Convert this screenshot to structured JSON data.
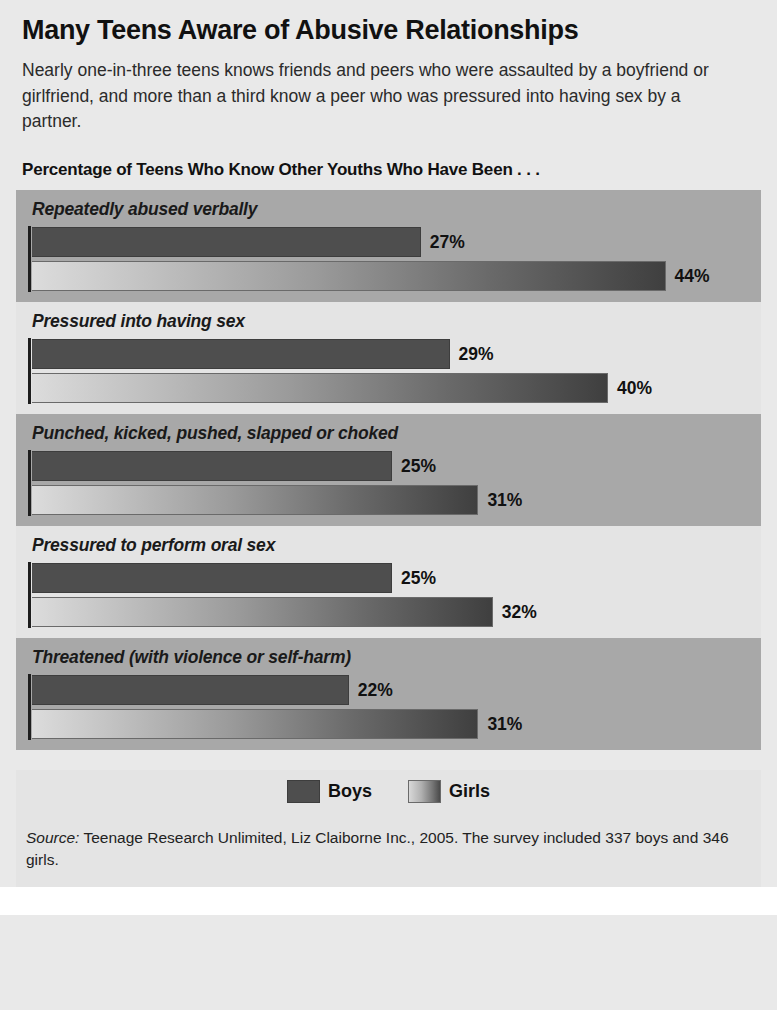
{
  "header": {
    "title": "Many Teens Aware of Abusive Relationships",
    "subtitle": "Nearly one-in-three teens knows friends and peers who were assaulted by a boyfriend or girlfriend, and more than a third know a peer who was pressured into having sex by a partner.",
    "section_label": "Percentage of Teens Who Know Other Youths Who Have Been . . ."
  },
  "legend": {
    "boys_label": "Boys",
    "girls_label": "Girls"
  },
  "source": {
    "prefix": "Source:",
    "text": " Teenage Research Unlimited, Liz Claiborne Inc., 2005. The survey included 337 boys and 346 girls."
  },
  "colors": {
    "band_dark": "#a8a8a8",
    "band_light": "#e4e4e4",
    "page_background": "#e9e9e9",
    "boys_bar": "#4e4e4e",
    "girls_bar_start": "#dcdcdc",
    "girls_bar_end": "#3f3f3f",
    "axis": "#1d1d1d",
    "text": "#111111"
  },
  "chart_data": {
    "type": "bar",
    "orientation": "horizontal",
    "title": "Many Teens Aware of Abusive Relationships",
    "subtitle": "Nearly one-in-three teens knows friends and peers who were assaulted by a boyfriend or girlfriend, and more than a third know a peer who was pressured into having sex by a partner.",
    "axis_label": "Percentage of Teens Who Know Other Youths Who Have Been . . .",
    "xlabel": "",
    "ylabel": "",
    "xlim": [
      0,
      50
    ],
    "grid": false,
    "legend_position": "bottom-center",
    "units": "%",
    "categories": [
      "Repeatedly abused verbally",
      "Pressured into having sex",
      "Punched, kicked, pushed, slapped or choked",
      "Pressured to perform oral sex",
      "Threatened (with violence or self-harm)"
    ],
    "series": [
      {
        "name": "Boys",
        "values": [
          27,
          29,
          25,
          25,
          22
        ],
        "labels": [
          "27%",
          "29%",
          "25%",
          "25%",
          "22%"
        ]
      },
      {
        "name": "Girls",
        "values": [
          44,
          40,
          31,
          32,
          31
        ],
        "labels": [
          "44%",
          "40%",
          "31%",
          "32%",
          "31%"
        ]
      }
    ],
    "source": "Source: Teenage Research Unlimited, Liz Claiborne Inc., 2005. The survey included 337 boys and 346 girls."
  }
}
